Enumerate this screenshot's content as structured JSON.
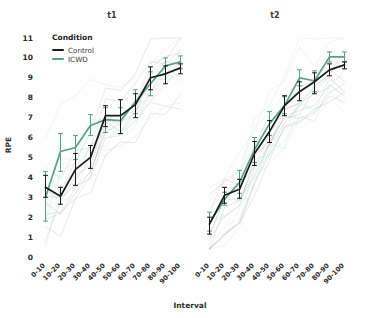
{
  "chart_data": {
    "type": "line",
    "title": "",
    "xlabel": "Interval",
    "ylabel": "RPE",
    "ylim": [
      0,
      11.3
    ],
    "yticks": [
      0,
      1,
      2,
      3,
      4,
      5,
      6,
      7,
      8,
      9,
      10,
      11
    ],
    "grid": false,
    "legend_position": "top-left inside",
    "legend_title": "Condition",
    "categories": [
      "0-10",
      "10-20",
      "20-30",
      "30-40",
      "40-50",
      "50-60",
      "60-70",
      "70-80",
      "80-90",
      "90-100"
    ],
    "facets": [
      {
        "name": "t1",
        "series": [
          {
            "name": "Control",
            "color": "#1a1a1a",
            "values": [
              3.5,
              3.05,
              4.4,
              5.0,
              7.1,
              7.1,
              7.65,
              9.0,
              9.2,
              9.5
            ],
            "err_low": [
              3.0,
              2.65,
              3.6,
              4.45,
              6.55,
              6.2,
              7.0,
              8.4,
              8.7,
              9.2
            ],
            "err_high": [
              4.1,
              3.5,
              5.2,
              5.6,
              7.6,
              7.9,
              8.2,
              9.55,
              9.6,
              9.7
            ]
          },
          {
            "name": "ICWD",
            "color": "#58a183",
            "values": [
              3.0,
              5.3,
              5.5,
              6.6,
              6.9,
              6.85,
              7.8,
              8.7,
              9.6,
              9.8
            ],
            "err_low": [
              1.8,
              4.3,
              4.9,
              6.1,
              6.25,
              6.2,
              7.2,
              8.1,
              9.2,
              9.45
            ],
            "err_high": [
              4.3,
              6.2,
              6.1,
              7.15,
              7.5,
              7.5,
              8.4,
              9.3,
              10.0,
              10.1
            ]
          }
        ]
      },
      {
        "name": "t2",
        "series": [
          {
            "name": "Control",
            "color": "#1a1a1a",
            "values": [
              1.65,
              3.1,
              3.4,
              5.2,
              6.3,
              7.6,
              8.3,
              8.8,
              9.4,
              9.65
            ],
            "err_low": [
              1.15,
              2.7,
              2.95,
              4.6,
              5.75,
              7.1,
              7.85,
              8.2,
              9.1,
              9.45
            ],
            "err_high": [
              2.0,
              3.5,
              3.9,
              5.8,
              6.85,
              8.1,
              8.8,
              9.25,
              9.7,
              9.8
            ]
          },
          {
            "name": "ICWD",
            "color": "#58a183",
            "values": [
              1.7,
              2.9,
              3.75,
              5.4,
              6.7,
              7.6,
              9.0,
              8.85,
              10.05,
              10.05
            ],
            "err_low": [
              1.3,
              2.6,
              3.2,
              4.75,
              6.1,
              7.2,
              8.6,
              8.3,
              9.8,
              9.8
            ],
            "err_high": [
              2.25,
              3.25,
              4.35,
              6.0,
              7.3,
              8.05,
              9.4,
              9.35,
              10.3,
              10.3
            ]
          }
        ]
      }
    ],
    "background_traces_note": "faint individual participant trajectories"
  },
  "legend": {
    "title": "Condition",
    "entries": [
      {
        "label": "Control",
        "color": "#1a1a1a"
      },
      {
        "label": "ICWD",
        "color": "#58a183"
      }
    ]
  },
  "axes": {
    "y_title": "RPE",
    "x_title": "Interval"
  },
  "panels": [
    {
      "title": "t1"
    },
    {
      "title": "t2"
    }
  ]
}
